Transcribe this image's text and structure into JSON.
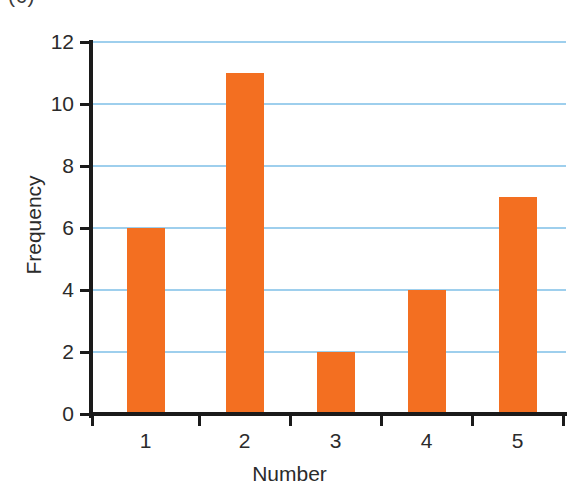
{
  "figure": {
    "panel_label": "(c)",
    "bar_color": "#f36f21",
    "gridline_color": "#9ecfed",
    "axis_color": "#1a1a1a",
    "background": "#ffffff"
  },
  "chart_data": {
    "type": "bar",
    "title": "",
    "categories": [
      "1",
      "2",
      "3",
      "4",
      "5"
    ],
    "values": [
      6,
      11,
      2,
      4,
      7
    ],
    "xlabel": "Number",
    "ylabel": "Frequency",
    "ylim": [
      0,
      12
    ],
    "ytick_labels": [
      "0",
      "2",
      "4",
      "6",
      "8",
      "10",
      "12"
    ],
    "ytick_values": [
      0,
      2,
      4,
      6,
      8,
      10,
      12
    ],
    "xtick_labels": [
      "1",
      "2",
      "3",
      "4",
      "5"
    ],
    "grid": "horizontal",
    "legend": "none"
  }
}
